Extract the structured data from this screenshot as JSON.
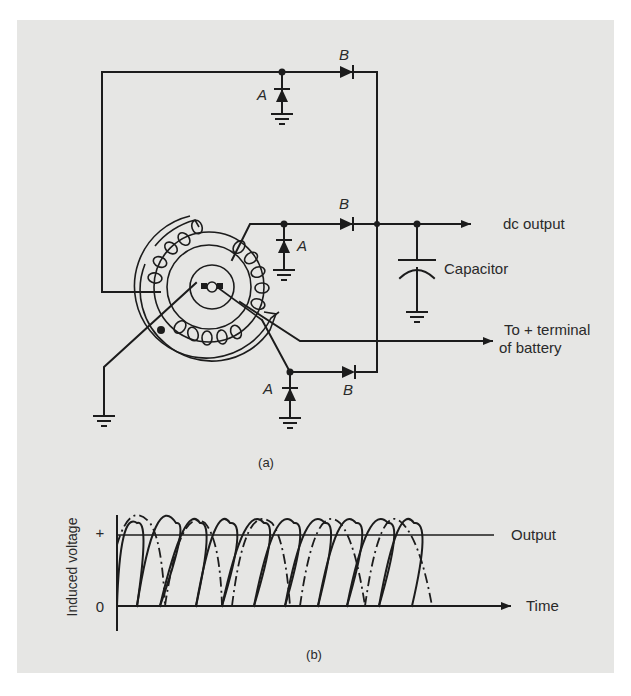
{
  "figure_a": {
    "caption": "(a)",
    "labels": {
      "diode_a": "A",
      "diode_b": "B",
      "dc_output": "dc output",
      "capacitor": "Capacitor",
      "battery_line1": "To + terminal",
      "battery_line2": "of battery"
    }
  },
  "figure_b": {
    "caption": "(b)",
    "y_axis_label": "Induced voltage",
    "y_tick_plus": "+",
    "y_tick_zero": "0",
    "x_axis_label": "Time",
    "output_label": "Output"
  },
  "colors": {
    "panel": "#e6e6e4",
    "ink": "#1c1c1c"
  }
}
